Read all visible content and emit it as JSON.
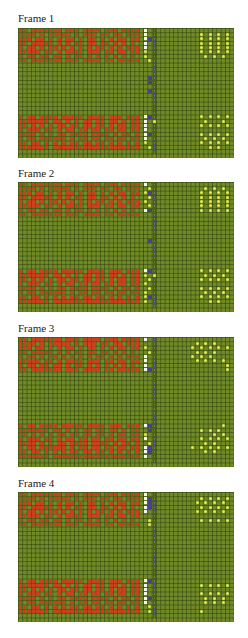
{
  "grid": {
    "cols": 50,
    "rows": 30,
    "cell_w": 4.32,
    "cell_h": 4.333
  },
  "legend_colors": {
    "background": "#6f8a26",
    "red": "#c8401e",
    "white": "#f4f4f0",
    "blue": "#4a3f8f",
    "gray": "#4c4c70",
    "yellow": "#e6e84a"
  },
  "frames": [
    {
      "label": "Frame 1",
      "label_top": 12,
      "grid_top": 28,
      "rows": [
        "RR.RRRRRRR.RRR.RRRR.RRR.RRRR.W.G.................",
        "RRRR.R.RRRRR.R.RRR.RR.RR.RRR.W.G..........Y.Y.Y.Y",
        "RRR.RR.R.R.RR.R.RR.R.R.RR.RR.WBG..........Y.Y.Y.Y",
        "RR.RRRRR.R.R.RR.RR.RR.R.R.R..W.G..........Y.Y.Y.Y",
        "R.RR.R.RR.R.R.R.R.RR.R.R.RRR.W.G..........Y.Y.Y.Y",
        "RRRRR.RR.R.RRRR.RRR.RR.RR.RR.Y.G..........Y.Y.Y.Y",
        "R.RR.RR.RR.R.RR.R.R.R.R.R.R..Y.G...........Y.Y.Y.",
        "RR.RRRRRRR.RRR.RRRR.RR.RRRRR..YG.................",
        "...............................G.................",
        "...............................G.................",
        "...............................G.................",
        "..............................BG.................",
        "..............................BG.................",
        "...............................G.................",
        "..............................BG.................",
        "...............................G.................",
        "...............................G.................",
        "...............................G.................",
        "...............................G.................",
        "...............................G.................",
        "R.RR.RRRR.RRRRR.RRRR.RRR.RRR.WBG..........Y.Y.Y.Y",
        "RRRRRRR.RR.R.R.RR.RR.RR.R.RR.W.Y...........Y...Y.",
        "RR.R.R.R.RR.RR.RR.RR.R.RR.RR.W.G..........Y.Y.Y.Y",
        "R.RRR.RR.R.RR.RR.RR.RR.RR.RR.W.G.................",
        "RRRR.R.R.RR.RRRR.RRRR.R.RR.R.WBG..........Y.Y.Y.Y",
        "R.RR.RRRRRR.R.RR.RR.RR.RR.RR.W.G...........Y.Y.Y.",
        "RR.RR.R.R.R.RR.RR.RR.R.R.R.R.Y.G..........Y.Y.Y.Y",
        "RRRRRRR.RRRRRRRRRRRRRRRRRRRR..YG............Y.Y..",
        "...............................G.................",
        ".................................................."
      ]
    },
    {
      "label": "Frame 2",
      "label_top": 167,
      "grid_top": 182,
      "rows": [
        "RR.RRRRRRR.RRR.RRRR.RRR.RRRR.W.G.................",
        "RRRR.R.RRRRR.R.RRR.RR.RR.RRR..YG...........Y.Y.Y.",
        "RRR.RR.R.R.RR.R.RR.R.R.RR.RR.YBG..........Y.Y.Y.Y",
        "RR.RRRRR.R.R.RR.RR.RR.R.R.R...YG..........Y.Y.Y.Y",
        "R.RR.R.RR.R.R.R.R.RR.R.R.RRR.Y.G..........Y.Y.Y.Y",
        "RRRRR.RR.R.RRRR.RRR.RR.RR.RR..YG..........Y.Y.Y.Y",
        "R.RR.RR.RR.R.RR.R.R.R.R.R.R..WBG..........Y.Y.Y.Y",
        "RR.RRRRRRR.RRR.RRRR.RR.RRRRR...G.................",
        "...............................G.................",
        "...............................G.................",
        "...............................G.................",
        "...............................G.................",
        "...............................G.................",
        "..............................BG.................",
        "...............................G.................",
        "...............................G.................",
        "...............................G.................",
        "...............................G.................",
        "...............................G.................",
        "...............................G.................",
        "R.RR.RRRR.RRRRR.RRRR.RRR.RRR.WBG..........Y.Y.Y.Y",
        "RRRRRRR.RR.R.R.RR.RR.RR.R.RR.Y.Y...........Y.Y.Y.",
        "RR.R.R.R.RR.RR.RR.RR.R.RR.RR..YG..........Y.Y.Y.Y",
        "R.RRR.RR.R.RR.RR.RR.RR.RR.RR.Y.G.................",
        "RRRR.R.R.RR.RRRR.RRRR.R.RR.R..YG..........Y.Y.Y.Y",
        "R.RR.RRRRRR.R.RR.RR.RR.RR.RR.Y.G...........Y.Y.Y.",
        "RR.RR.R.R.R.RR.RR.RR.R.R.R.R.YBG..........Y.Y.Y.Y",
        "RRRRRRR.RRRRRRRRRRRRRRRRRRRR.Y.G............Y.Y..",
        "...............................G.................",
        ".................................................."
      ]
    },
    {
      "label": "Frame 3",
      "label_top": 322,
      "grid_top": 337,
      "rows": [
        "RR.RRRRRRR.RRR.RRRR.RRR.RRRR.W.G.................",
        "RRRR.R.RRRRR.R.RRR.RR.RR.RRR...G.........Y.Y.Y...",
        "RRR.RR.R.R.RR.R.RR.R.R.RR.RR.Y.G........Y.Y.Y.Y.Y",
        "RR.RRRRR.R.R.RR.RR.RR.R.R.R...YG.........Y.Y.Y...",
        "R.RR.R.RR.R.R.R.R.RR.R.R.RRR.W.G........Y.Y.Y....",
        "RRRRR.RR.R.RRRR.RRR.RR.RR.RR.W.G.........Y.Y.Y.Y.",
        "R.RR.RR.RR.R.RR.R.R.R.R.R.R..W.G................Y",
        "RR.RRRRRRR.RRR.RRRR.RR.RRRRR.WBG................Y",
        "...............................G.................",
        "...............................G.................",
        "...............................G.................",
        "...............................G.................",
        "...............................G.................",
        "...............................G.................",
        "...............................G.................",
        "...............................G.................",
        "...............................G.................",
        "...............................G.................",
        "...............................G.................",
        "...............................G.................",
        "R.RR.RRRR.RRRRR.RRRR.RRR.RRR.WBG...............Y.",
        "RRRRRRR.RR.R.R.RR.RR.RR.R.RR..BG..........Y.Y.Y..",
        "RR.R.R.R.RR.RR.RR.RR.R.RR.RR.Y.G.............Y.Y.",
        "R.RRR.RR.R.RR.RR.RR.RR.RR.RR.W.G..........Y.Y.Y.Y",
        "RRRR.R.R.RR.RRRR.RRRR.R.RR.R..YG...........Y.Y...",
        "R.RR.RRRRRR.R.RR.RR.RR.RR.RR.WBG........Y.Y.Y.Y.Y",
        "RR.RR.R.R.R.RR.RR.RR.R.R.R.R.WBG...........Y.Y...",
        "RRRRRRR.RRRRRRRRRRRRRRRRRRRR.W.G.................",
        "...............................G.................",
        ".................................................."
      ]
    },
    {
      "label": "Frame 4",
      "label_top": 477,
      "grid_top": 492,
      "rows": [
        "RR.RRRRRRR.RRR.RRRR.RRR.RRRR.W.G.................",
        "RRRR.R.RRRRR.R.RRR.RR.RR.RRR.WBG..........Y.Y.Y.Y",
        "RRR.RR.R.R.RR.R.RR.R.R.RR.RR.WBG.........Y.Y.Y.Y.",
        "RR.RRRRR.R.R.RR.RR.RR.R.R.R..WBG..........Y.Y.Y.Y",
        "R.RR.R.RR.R.R.R.R.RR.R.R.RRR.W.G.........Y.Y.Y.Y.",
        "RRRRR.RR.R.RRRR.RRR.RR.RR.RR...G.................",
        "R.RR.RR.RR.R.RR.R.R.R.R.R.R...YG..........Y.Y.Y.Y",
        "RR.RRRRRRR.RRR.RRRR.RR.RRRRR..YG.................",
        "...............................G.................",
        "...............................G.................",
        "...............................G.................",
        "...............................G.................",
        "...............................G.................",
        "...............................G.................",
        "...............................G.................",
        "...............................G.................",
        "...............................G.................",
        "...............................G.................",
        "...............................G.................",
        "...............................G.................",
        "R.RR.RRRR.RRRRR.RRRR.RRR.RRR.WBG.................",
        "RRRRRRR.RR.R.R.RR.RR.RR.R.RR.W.G..........Y.Y.Y.Y",
        "RR.R.R.R.RR.RR.RR.RR.R.RR.RR.W.G.................",
        "R.RRR.RR.R.RR.RR.RR.RR.RR.RR.W.G..........Y.Y.Y.Y",
        "RRRR.R.R.RR.RRRR.RRRR.R.RR.R.WBG...........Y.Y.Y.",
        "R.RR.RRRRRR.R.RR.RR.RR.RR.RR.W.G...........Y.Y.Y.",
        "RR.RR.R.R.R.RR.RR.RR.R.R.R.R..YG.................",
        "RRRRRRR.RRRRRRRRRRRRRRRRRRRR..YG..........Y......",
        "...............................G.................",
        ".................................................."
      ]
    }
  ]
}
